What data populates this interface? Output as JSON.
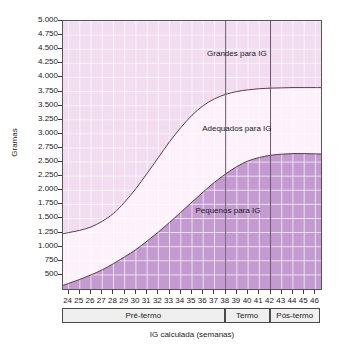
{
  "chart_data": {
    "type": "area",
    "title": "",
    "xlabel": "IG calculada (semanas)",
    "ylabel": "Gramas",
    "xlim": [
      23.5,
      46.5
    ],
    "ylim": [
      250,
      5000
    ],
    "grid": true,
    "legend_position": "in-plot-annotations",
    "x_tick_labels": [
      "24",
      "25",
      "26",
      "27",
      "28",
      "29",
      "30",
      "31",
      "32",
      "33",
      "34",
      "35",
      "36",
      "37",
      "38",
      "39",
      "40",
      "41",
      "42",
      "43",
      "44",
      "45",
      "46"
    ],
    "y_tick_labels": [
      "5.000",
      "4.750",
      "4.500",
      "4.250",
      "4.000",
      "3.750",
      "3.500",
      "3.250",
      "3.000",
      "2.750",
      "2.500",
      "2.250",
      "2.000",
      "1.750",
      "1.500",
      "1.250",
      "1.000",
      "750",
      "500"
    ],
    "y_tick_values": [
      5000,
      4750,
      4500,
      4250,
      4000,
      3750,
      3500,
      3250,
      3000,
      2750,
      2500,
      2250,
      2000,
      1750,
      1500,
      1250,
      1000,
      750,
      500
    ],
    "x": [
      24,
      25,
      26,
      27,
      28,
      29,
      30,
      31,
      32,
      33,
      34,
      35,
      36,
      37,
      38,
      39,
      40,
      41,
      42,
      43,
      44,
      45,
      46
    ],
    "series": [
      {
        "name": "Limite superior (P90)",
        "label": "Grandes para IG",
        "values": [
          1250,
          1290,
          1350,
          1450,
          1590,
          1790,
          2030,
          2300,
          2580,
          2860,
          3110,
          3330,
          3500,
          3620,
          3700,
          3750,
          3780,
          3800,
          3810,
          3815,
          3820,
          3820,
          3820
        ]
      },
      {
        "name": "Limite inferior (P10)",
        "label": "Pequenos para IG",
        "values": [
          350,
          420,
          500,
          590,
          700,
          820,
          950,
          1100,
          1260,
          1430,
          1610,
          1790,
          1970,
          2140,
          2290,
          2420,
          2520,
          2580,
          2620,
          2640,
          2650,
          2650,
          2645
        ]
      }
    ],
    "bands": [
      {
        "name": "Grandes para IG",
        "color": "#f2dcf0",
        "position": "above upper curve"
      },
      {
        "name": "Adequados para IG",
        "color": "#fdf1fb",
        "position": "between curves"
      },
      {
        "name": "Pequenos para IG",
        "color": "#c49bd1",
        "position": "below lower curve"
      }
    ],
    "annotations": [
      {
        "text": "Grandes para IG",
        "x": 39.0,
        "y": 4420
      },
      {
        "text": "Adequados para IG",
        "x": 39.0,
        "y": 3080
      },
      {
        "text": "Pequenos para IG",
        "x": 38.2,
        "y": 1640
      }
    ],
    "zone_dividers": [
      38,
      42
    ],
    "zones": [
      {
        "label": "Pré-termo",
        "start": 24,
        "end": 38
      },
      {
        "label": "Termo",
        "start": 38,
        "end": 42
      },
      {
        "label": "Pós-termo",
        "start": 42,
        "end": 46
      }
    ],
    "colors": {
      "band_upper": "#f2dcf0",
      "band_middle": "#fdf1fb",
      "band_lower": "#c49bd1",
      "curve": "#5a3a52",
      "grid": "#ffffff",
      "axis": "#555555",
      "zone_box_fill": "#efefef",
      "zone_box_border": "#4a4a4a"
    }
  }
}
